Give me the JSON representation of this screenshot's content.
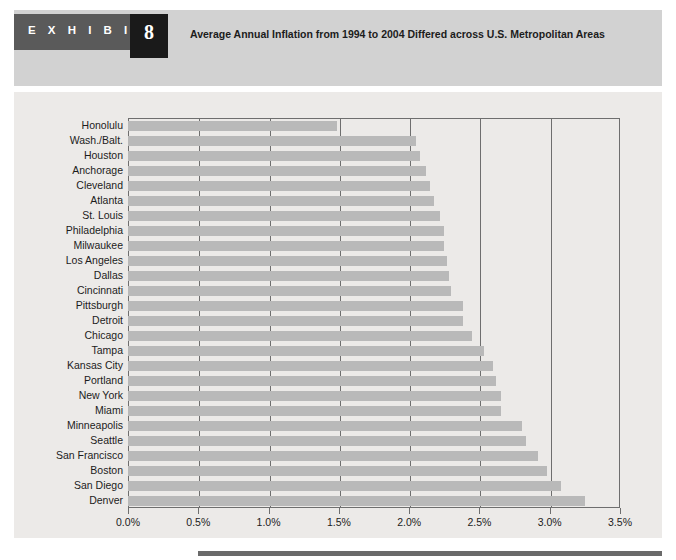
{
  "exhibit": {
    "label": "E X H I B I T",
    "number": "8",
    "title": "Average Annual Inflation from 1994 to 2004 Differed across U.S. Metropolitan Areas"
  },
  "colors": {
    "banner": "#d2d2d2",
    "tab": "#5a5a5a",
    "number_box": "#1a1a1a",
    "panel": "#eceae8",
    "bar": "#b9b9b9",
    "axis": "#6e6e6e",
    "text": "#1c1c1c"
  },
  "chart_data": {
    "type": "bar",
    "orientation": "horizontal",
    "title": "Average Annual Inflation from 1994 to 2004 Differed across U.S. Metropolitan Areas",
    "xlabel": "",
    "ylabel": "",
    "xlim": [
      0.0,
      3.5
    ],
    "xticks": [
      0.0,
      0.5,
      1.0,
      1.5,
      2.0,
      2.5,
      3.0,
      3.5
    ],
    "xticklabels": [
      "0.0%",
      "0.5%",
      "1.0%",
      "1.5%",
      "2.0%",
      "2.5%",
      "3.0%",
      "3.5%"
    ],
    "grid": true,
    "legend": null,
    "categories": [
      "Honolulu",
      "Wash./Balt.",
      "Houston",
      "Anchorage",
      "Cleveland",
      "Atlanta",
      "St. Louis",
      "Philadelphia",
      "Milwaukee",
      "Los Angeles",
      "Dallas",
      "Cincinnati",
      "Pittsburgh",
      "Detroit",
      "Chicago",
      "Tampa",
      "Kansas City",
      "Portland",
      "New York",
      "Miami",
      "Minneapolis",
      "Seattle",
      "San Francisco",
      "Boston",
      "San Diego",
      "Denver"
    ],
    "values": [
      1.49,
      2.05,
      2.08,
      2.12,
      2.15,
      2.18,
      2.22,
      2.25,
      2.25,
      2.27,
      2.28,
      2.3,
      2.38,
      2.38,
      2.45,
      2.53,
      2.6,
      2.62,
      2.65,
      2.65,
      2.8,
      2.83,
      2.92,
      2.98,
      3.08,
      3.25
    ]
  }
}
